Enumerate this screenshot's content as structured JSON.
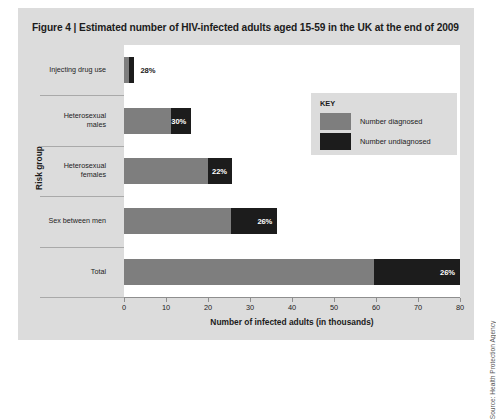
{
  "figure": {
    "title": "Figure 4 | Estimated number of HIV-infected adults aged 15-59 in the UK at the end of 2009",
    "source_credit": "Source: Health Protection Agency"
  },
  "legend": {
    "title": "KEY",
    "entries": [
      {
        "label": "Number diagnosed",
        "color": "#7e7e7e"
      },
      {
        "label": "Number undiagnosed",
        "color": "#1c1c1c"
      }
    ]
  },
  "colors": {
    "card_background": "#dcdcdc",
    "plot_background": "#ffffff",
    "diagnosed": "#7e7e7e",
    "undiagnosed": "#1c1c1c",
    "axis": "#8e8e8e",
    "text": "#1b1b1b"
  },
  "chart_data": {
    "type": "bar",
    "orientation": "horizontal",
    "stacked": true,
    "title": "Figure 4 | Estimated number of HIV-infected adults aged 15-59 in the UK at the end of 2009",
    "xlabel": "Number of infected adults (in thousands)",
    "ylabel": "Risk group",
    "xlim": [
      0,
      80
    ],
    "xticks": [
      0,
      10,
      20,
      30,
      40,
      50,
      60,
      70,
      80
    ],
    "xtick_labels": [
      "0",
      "10",
      "20",
      "30",
      "40",
      "50",
      "60",
      "70",
      "80"
    ],
    "grid": false,
    "legend_position": "inside-upper-right",
    "categories": [
      "Injecting drug use",
      "Heterosexual males",
      "Heterosexual females",
      "Sex between men",
      "Total"
    ],
    "series": [
      {
        "name": "Number diagnosed",
        "color": "#7e7e7e",
        "values": [
          1.2,
          11.2,
          20.0,
          25.5,
          59.5
        ]
      },
      {
        "name": "Number undiagnosed",
        "color": "#1c1c1c",
        "values": [
          1.3,
          4.8,
          5.7,
          11.0,
          20.5
        ]
      }
    ],
    "totals": [
      2.5,
      16.0,
      25.7,
      36.5,
      80.0
    ],
    "data_labels": [
      "28%",
      "30%",
      "22%",
      "26%",
      "26%"
    ],
    "data_label_note": "percentage undiagnosed"
  },
  "bars": [
    {
      "category_line1": "Injecting drug use",
      "category_line2": "",
      "pct": "28%",
      "pct_inside": false
    },
    {
      "category_line1": "Heterosexual",
      "category_line2": "males",
      "pct": "30%",
      "pct_inside": true
    },
    {
      "category_line1": "Heterosexual",
      "category_line2": "females",
      "pct": "22%",
      "pct_inside": true
    },
    {
      "category_line1": "Sex between men",
      "category_line2": "",
      "pct": "26%",
      "pct_inside": true
    },
    {
      "category_line1": "Total",
      "category_line2": "",
      "pct": "26%",
      "pct_inside": true
    }
  ],
  "axis": {
    "ticks": [
      "0",
      "10",
      "20",
      "30",
      "40",
      "50",
      "60",
      "70",
      "80"
    ],
    "x_title": "Number of infected adults (in thousands)",
    "y_title": "Risk group"
  }
}
